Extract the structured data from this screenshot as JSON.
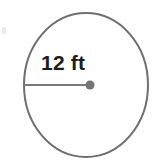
{
  "figure": {
    "kind": "geometry-diagram",
    "shape_name": "circle",
    "background_color": "#ffffff",
    "canvas": {
      "width": 157,
      "height": 164
    },
    "circle": {
      "stroke_color": "#6f6f6f",
      "stroke_width": 2,
      "fill": "none",
      "center_x": 86,
      "center_y": 85,
      "radius_x": 62,
      "radius_y": 72
    },
    "radius_segment": {
      "label": "12 ft",
      "value": "12",
      "unit": "ft",
      "stroke_color": "#7a7a7a",
      "stroke_width": 2,
      "start_x": 24,
      "start_y": 85,
      "end_x": 90,
      "end_y": 85
    },
    "center_point": {
      "color": "#737373",
      "x": 90,
      "y": 85,
      "radius": 4.5
    },
    "label_position": {
      "x": 41,
      "y": 70
    },
    "label_color": "#1d1d1d",
    "edge_artifact": {
      "color": "#e6e6e6",
      "x": 2,
      "y": 27,
      "width": 4,
      "height": 7
    }
  }
}
